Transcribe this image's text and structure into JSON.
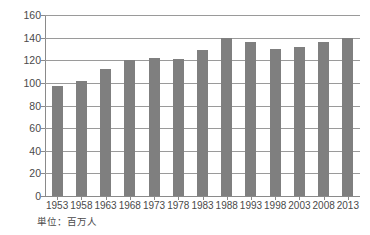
{
  "chart_data": {
    "type": "bar",
    "title": "",
    "subtitle": "",
    "xlabel": "",
    "ylabel": "",
    "unit_caption": "単位：百万人",
    "categories": [
      "1953",
      "1958",
      "1963",
      "1968",
      "1973",
      "1978",
      "1983",
      "1988",
      "1993",
      "1998",
      "2003",
      "2008",
      "2013"
    ],
    "values": [
      97,
      102,
      112,
      120,
      122,
      121,
      129,
      140,
      136,
      130,
      132,
      136,
      140
    ],
    "series": [
      {
        "name": "",
        "values": [
          97,
          102,
          112,
          120,
          122,
          121,
          129,
          140,
          136,
          130,
          132,
          136,
          140
        ]
      }
    ],
    "ylim": [
      0,
      160
    ],
    "ytick_labels": [
      "160",
      "140",
      "120",
      "100",
      "80",
      "60",
      "40",
      "20",
      "0"
    ],
    "ytick_values": [
      160,
      140,
      120,
      100,
      80,
      60,
      40,
      20,
      0
    ],
    "grid": true,
    "grid_axis": "y",
    "legend": false,
    "legend_position": "none",
    "bar_color": "#7f7f7f",
    "grid_color": "#9a9a9a",
    "axis_color": "#8a8a8a",
    "text_color": "#4a4a4a",
    "background_color": "#ffffff"
  }
}
